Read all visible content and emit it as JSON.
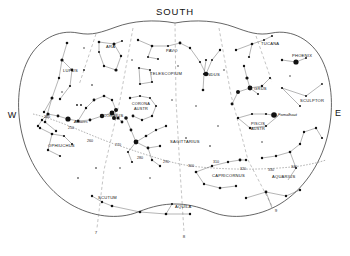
{
  "chart": {
    "cardinals": {
      "south": "SOUTH",
      "west": "W",
      "east": "E"
    },
    "constellations": [
      {
        "name": "LUPUS",
        "x": 63,
        "y": 72
      },
      {
        "name": "ARA",
        "x": 106,
        "y": 48
      },
      {
        "name": "PAVO",
        "x": 166,
        "y": 52
      },
      {
        "name": "TUCANA",
        "x": 261,
        "y": 45
      },
      {
        "name": "PHOENIX",
        "x": 292,
        "y": 57
      },
      {
        "name": "TELESCOPIUM",
        "x": 150,
        "y": 75
      },
      {
        "name": "INDUS",
        "x": 206,
        "y": 76
      },
      {
        "name": "GRUS",
        "x": 254,
        "y": 90
      },
      {
        "name": "SCULPTOR",
        "x": 300,
        "y": 102
      },
      {
        "name": "SCORPIUS",
        "x": 100,
        "y": 117
      },
      {
        "name": "CORONA",
        "x": 141,
        "y": 105
      },
      {
        "name": "AUSTR",
        "x": 141,
        "y": 110
      },
      {
        "name": "SAGITTARIUS",
        "x": 170,
        "y": 143
      },
      {
        "name": "PISCIS",
        "x": 258,
        "y": 125
      },
      {
        "name": "AUSTR",
        "x": 258,
        "y": 130
      },
      {
        "name": "OPHIUCHUS",
        "x": 48,
        "y": 147
      },
      {
        "name": "CAPRICORNUS",
        "x": 212,
        "y": 177
      },
      {
        "name": "AQUARIUS",
        "x": 272,
        "y": 178
      },
      {
        "name": "SCUTUM",
        "x": 98,
        "y": 199
      },
      {
        "name": "AQUILA",
        "x": 175,
        "y": 208
      }
    ],
    "star_names": [
      {
        "name": "Antares",
        "x": 74,
        "y": 123
      },
      {
        "name": "Fomalhaut",
        "x": 278,
        "y": 116
      }
    ],
    "ra_labels": [
      {
        "value": "240",
        "x": 44,
        "y": 118
      },
      {
        "value": "250",
        "x": 68,
        "y": 129
      },
      {
        "value": "260",
        "x": 87,
        "y": 142
      },
      {
        "value": "270",
        "x": 115,
        "y": 146
      },
      {
        "value": "280",
        "x": 137,
        "y": 159
      },
      {
        "value": "290",
        "x": 163,
        "y": 163
      },
      {
        "value": "300",
        "x": 188,
        "y": 167
      },
      {
        "value": "310",
        "x": 213,
        "y": 163
      },
      {
        "value": "320",
        "x": 240,
        "y": 170
      },
      {
        "value": "330",
        "x": 268,
        "y": 171
      },
      {
        "value": "340",
        "x": 291,
        "y": 168
      }
    ],
    "hour_labels": [
      {
        "value": "7",
        "x": 96,
        "y": 234
      },
      {
        "value": "8",
        "x": 184,
        "y": 238
      },
      {
        "value": "9",
        "x": 276,
        "y": 212
      }
    ]
  }
}
